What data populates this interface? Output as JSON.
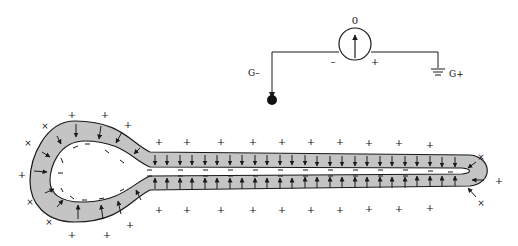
{
  "diagram": {
    "type": "electrode-potential-diagram",
    "colors": {
      "line": "#1a1a1a",
      "membrane_fill": "#c4c4c4",
      "background": "#ffffff"
    },
    "circuit": {
      "meter_reading": "0",
      "meter_minus": "–",
      "meter_plus": "+",
      "left_terminal_label": "G–",
      "right_terminal_label": "G+"
    },
    "charges": {
      "outside_sign": "+",
      "inside_sign": "–",
      "tip_sign": "×"
    }
  }
}
